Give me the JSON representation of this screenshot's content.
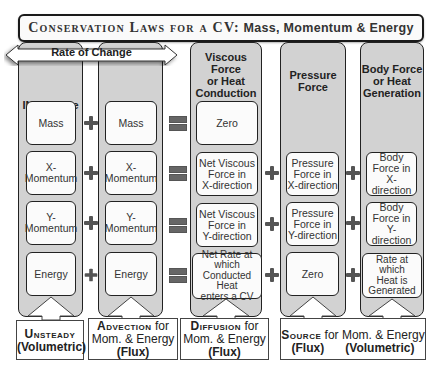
{
  "title": {
    "small_caps_part": "Conservation Laws for a CV:",
    "bold_part": "Mass, Momentum & Energy"
  },
  "rate_of_change": "Rate of Change",
  "columns": [
    {
      "header": [
        "INSIDE the",
        "CV"
      ],
      "cells": [
        "Mass",
        "X-\nMomentum",
        "Y-\nMomentum",
        "Energy"
      ]
    },
    {
      "header": [
        "ACROSS the",
        "CV"
      ],
      "cells": [
        "Mass",
        "X-\nMomentum",
        "Y-\nMomentum",
        "Energy"
      ]
    },
    {
      "header": [
        "Viscous Force",
        "or Heat",
        "Conduction"
      ],
      "cells": [
        "Zero",
        "Net Viscous\nForce in\nX-direction",
        "Net Viscous\nForce in\nY-direction",
        "Net Rate at\nwhich\nConducted Heat\nenters a CV"
      ]
    },
    {
      "header": [
        "Pressure",
        "Force"
      ],
      "cells": [
        "",
        "Pressure\nForce in\nX-direction",
        "Pressure\nForce in\nY-direction",
        "Zero"
      ]
    },
    {
      "header": [
        "Body Force",
        "or Heat",
        "Generation"
      ],
      "cells": [
        "",
        "Body\nForce in\nX-direction",
        "Body\nForce in\nY-direction",
        "Rate at which\nHeat is\nGenerated"
      ]
    }
  ],
  "operators": {
    "plus": "+",
    "equals": "="
  },
  "bottom_labels": {
    "unsteady": {
      "title": "Unsteady",
      "sub": "(Volumetric)"
    },
    "advection": {
      "title": "Advection",
      "for": " for",
      "line2": "Mom. & Energy",
      "sub": "(Flux)"
    },
    "diffusion": {
      "title": "Diffusion",
      "for": " for",
      "line2": "Mom. & Energy",
      "sub": "(Flux)"
    },
    "source": {
      "title": "Source",
      "for": " for Mom. & Energy",
      "sub_left": "(Flux)",
      "sub_right": "(Volumetric)"
    }
  },
  "colors": {
    "column_fill": "#d2d2d2",
    "cell_fill": "#fbfbfb",
    "border": "#222222",
    "operator": "#555555"
  }
}
